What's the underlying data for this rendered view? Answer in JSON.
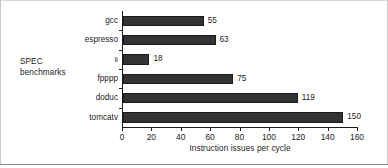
{
  "chart_data": {
    "type": "bar",
    "orientation": "horizontal",
    "title": "",
    "xlabel": "Instruction issues per cycle",
    "ylabel": "SPEC benchmarks",
    "categories": [
      "gcc",
      "espresso",
      "li",
      "fpppp",
      "doduc",
      "tomcatv"
    ],
    "values": [
      55,
      63,
      18,
      75,
      119,
      150
    ],
    "value_labels": [
      "55",
      "63",
      "18",
      "75",
      "119",
      "150"
    ],
    "xlim": [
      0,
      160
    ],
    "xticks": [
      0,
      20,
      40,
      60,
      80,
      100,
      120,
      140,
      160
    ],
    "xtick_labels": [
      "0",
      "20",
      "40",
      "60",
      "80",
      "100",
      "120",
      "140",
      "160"
    ],
    "grid": false,
    "legend": null,
    "bar_color": "#333333",
    "axis_color": "#1a1a1a",
    "background": "#ffffff"
  },
  "figure": {
    "yaxis_title_line1": "SPEC",
    "yaxis_title_line2": "benchmarks",
    "xaxis_title": "Instruction issues per cycle"
  }
}
